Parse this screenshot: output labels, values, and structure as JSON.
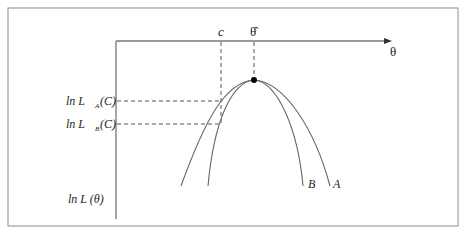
{
  "diagram": {
    "x_axis_label": "θ",
    "y_axis_label": "ln L (θ)",
    "top_labels": {
      "c": "c",
      "theta_hat": "θ̂"
    },
    "y_markers": [
      {
        "label_prefix": "ln L",
        "subscript": "A",
        "suffix": "(C)"
      },
      {
        "label_prefix": "ln L",
        "subscript": "B",
        "suffix": "(C)"
      }
    ],
    "curves": [
      {
        "name": "A",
        "label": "A"
      },
      {
        "name": "B",
        "label": "B"
      }
    ],
    "colors": {
      "line": "#555555",
      "frame": "#999999",
      "text": "#222222",
      "dot": "#000000"
    }
  }
}
